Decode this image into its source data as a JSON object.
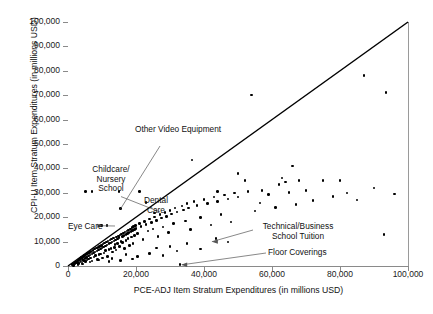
{
  "chart_data": {
    "type": "scatter",
    "title": "",
    "xlabel": "PCE-ADJ Item Stratum Expenditures (in millions USD)",
    "ylabel": "CPI-U Item Stratum Expenditures (in millions USD)",
    "xlim": [
      0,
      100000
    ],
    "ylim": [
      0,
      100000
    ],
    "xticks": [
      0,
      20000,
      40000,
      60000,
      80000,
      100000
    ],
    "xticklabels": [
      "0",
      "20,000",
      "40,000",
      "60,000",
      "80,000",
      "100,000"
    ],
    "yticks": [
      0,
      10000,
      20000,
      30000,
      40000,
      50000,
      60000,
      70000,
      80000,
      90000,
      100000
    ],
    "yticklabels": [
      "0",
      "10,000",
      "20,000",
      "30,000",
      "40,000",
      "50,000",
      "60,000",
      "70,000",
      "80,000",
      "90,000",
      "100,000"
    ],
    "grid": false,
    "legend": null,
    "marker": "filled-circle",
    "marker_color": "#000000",
    "reference_line": {
      "name": "identity-line",
      "description": "45-degree y = x line",
      "from": [
        0,
        0
      ],
      "to": [
        100000,
        100000
      ],
      "color": "#000000"
    },
    "annotations": [
      {
        "label": "Other Video Equipment",
        "point": [
          15500,
          23500
        ]
      },
      {
        "label": "Childcare/\nNursery\nSchool",
        "point": [
          7000,
          30500
        ]
      },
      {
        "label": "Dental\nCare",
        "point": [
          15000,
          30500
        ]
      },
      {
        "label": "Eye Care",
        "point": [
          9800,
          16500
        ]
      },
      {
        "label": "Technical/Business\nSchool Tuition",
        "point": [
          93000,
          13000
        ]
      },
      {
        "label": "Floor Coverings",
        "point": [
          33000,
          500
        ]
      }
    ],
    "points": [
      [
        1200,
        600
      ],
      [
        1500,
        900
      ],
      [
        1800,
        1100
      ],
      [
        2000,
        800
      ],
      [
        2200,
        1500
      ],
      [
        2400,
        1200
      ],
      [
        2600,
        1900
      ],
      [
        2800,
        1400
      ],
      [
        3000,
        2200
      ],
      [
        3100,
        1000
      ],
      [
        3300,
        2600
      ],
      [
        3500,
        1700
      ],
      [
        3600,
        3000
      ],
      [
        3800,
        2100
      ],
      [
        4000,
        3400
      ],
      [
        4100,
        1300
      ],
      [
        4300,
        2800
      ],
      [
        4500,
        3900
      ],
      [
        4600,
        2300
      ],
      [
        4800,
        4300
      ],
      [
        5000,
        3100
      ],
      [
        5100,
        1800
      ],
      [
        5300,
        4800
      ],
      [
        5500,
        3600
      ],
      [
        5600,
        2500
      ],
      [
        5800,
        5200
      ],
      [
        6000,
        4100
      ],
      [
        6100,
        2900
      ],
      [
        6300,
        5600
      ],
      [
        6500,
        4500
      ],
      [
        6600,
        3300
      ],
      [
        6800,
        6000
      ],
      [
        7000,
        4900
      ],
      [
        7100,
        2000
      ],
      [
        7300,
        6400
      ],
      [
        7500,
        5300
      ],
      [
        7600,
        3700
      ],
      [
        7800,
        6900
      ],
      [
        8000,
        5700
      ],
      [
        8100,
        4200
      ],
      [
        8300,
        7300
      ],
      [
        8500,
        6100
      ],
      [
        8600,
        2700
      ],
      [
        8800,
        7700
      ],
      [
        9000,
        6500
      ],
      [
        9100,
        4600
      ],
      [
        9300,
        8100
      ],
      [
        9500,
        7000
      ],
      [
        9600,
        5000
      ],
      [
        9800,
        8500
      ],
      [
        10000,
        7400
      ],
      [
        10100,
        3200
      ],
      [
        10300,
        9000
      ],
      [
        10500,
        7800
      ],
      [
        10600,
        5400
      ],
      [
        10800,
        9400
      ],
      [
        11000,
        8200
      ],
      [
        11100,
        6300
      ],
      [
        11300,
        9800
      ],
      [
        11500,
        8600
      ],
      [
        11600,
        4000
      ],
      [
        11800,
        10200
      ],
      [
        12000,
        9100
      ],
      [
        12100,
        6800
      ],
      [
        12300,
        10600
      ],
      [
        12500,
        9500
      ],
      [
        12600,
        7200
      ],
      [
        12800,
        11000
      ],
      [
        13000,
        9900
      ],
      [
        13100,
        5800
      ],
      [
        13300,
        11500
      ],
      [
        13500,
        10300
      ],
      [
        13600,
        7600
      ],
      [
        13800,
        8900
      ],
      [
        14000,
        10700
      ],
      [
        14100,
        6600
      ],
      [
        14300,
        11900
      ],
      [
        14500,
        11100
      ],
      [
        14600,
        9300
      ],
      [
        14800,
        12300
      ],
      [
        15000,
        11600
      ],
      [
        15100,
        8000
      ],
      [
        15300,
        12700
      ],
      [
        15500,
        23500
      ],
      [
        15600,
        10000
      ],
      [
        15800,
        13100
      ],
      [
        16000,
        12000
      ],
      [
        16100,
        9700
      ],
      [
        16300,
        13600
      ],
      [
        16500,
        12400
      ],
      [
        16600,
        7100
      ],
      [
        16800,
        14000
      ],
      [
        17000,
        12800
      ],
      [
        17100,
        10400
      ],
      [
        17300,
        14400
      ],
      [
        17500,
        13200
      ],
      [
        17600,
        11200
      ],
      [
        17800,
        14800
      ],
      [
        18000,
        13700
      ],
      [
        18100,
        8400
      ],
      [
        18300,
        15200
      ],
      [
        18500,
        14100
      ],
      [
        18600,
        11900
      ],
      [
        18800,
        15700
      ],
      [
        19000,
        14500
      ],
      [
        19100,
        9200
      ],
      [
        19300,
        16100
      ],
      [
        19500,
        15000
      ],
      [
        19600,
        12600
      ],
      [
        19800,
        16500
      ],
      [
        20000,
        15400
      ],
      [
        20500,
        13400
      ],
      [
        21000,
        17400
      ],
      [
        21500,
        16200
      ],
      [
        22000,
        10900
      ],
      [
        22500,
        18300
      ],
      [
        23000,
        17000
      ],
      [
        23500,
        14300
      ],
      [
        24000,
        19200
      ],
      [
        24500,
        17900
      ],
      [
        25000,
        15100
      ],
      [
        25500,
        20100
      ],
      [
        26000,
        18700
      ],
      [
        26500,
        12100
      ],
      [
        27000,
        21000
      ],
      [
        27500,
        19600
      ],
      [
        28000,
        16000
      ],
      [
        28500,
        21900
      ],
      [
        29000,
        20400
      ],
      [
        29500,
        13800
      ],
      [
        30000,
        22800
      ],
      [
        30500,
        21300
      ],
      [
        31000,
        17500
      ],
      [
        31500,
        23700
      ],
      [
        32000,
        22100
      ],
      [
        33000,
        500
      ],
      [
        33500,
        24600
      ],
      [
        34000,
        23000
      ],
      [
        34500,
        18400
      ],
      [
        35000,
        25500
      ],
      [
        35500,
        23800
      ],
      [
        36000,
        14900
      ],
      [
        37000,
        26400
      ],
      [
        38000,
        24700
      ],
      [
        39000,
        19800
      ],
      [
        40000,
        27300
      ],
      [
        41000,
        25600
      ],
      [
        42000,
        16800
      ],
      [
        43000,
        28200
      ],
      [
        44000,
        26500
      ],
      [
        45000,
        21200
      ],
      [
        46000,
        29100
      ],
      [
        47000,
        27400
      ],
      [
        48000,
        18000
      ],
      [
        49000,
        30000
      ],
      [
        50000,
        28300
      ],
      [
        52000,
        35000
      ],
      [
        54000,
        70000
      ],
      [
        55000,
        22600
      ],
      [
        57000,
        31000
      ],
      [
        59000,
        29200
      ],
      [
        61000,
        23900
      ],
      [
        63000,
        36000
      ],
      [
        64000,
        34500
      ],
      [
        65000,
        30100
      ],
      [
        67000,
        25200
      ],
      [
        68000,
        35000
      ],
      [
        70000,
        31000
      ],
      [
        72000,
        26800
      ],
      [
        75000,
        35000
      ],
      [
        78000,
        28400
      ],
      [
        80000,
        35000
      ],
      [
        82000,
        30000
      ],
      [
        85000,
        27000
      ],
      [
        87000,
        78000
      ],
      [
        90000,
        32000
      ],
      [
        93000,
        13000
      ],
      [
        93500,
        71000
      ],
      [
        96000,
        29500
      ],
      [
        5200,
        30500
      ],
      [
        7000,
        30500
      ],
      [
        15000,
        30500
      ],
      [
        9800,
        16500
      ],
      [
        11500,
        16500
      ],
      [
        21000,
        30500
      ],
      [
        23000,
        26000
      ],
      [
        25500,
        21800
      ],
      [
        36500,
        43500
      ],
      [
        44000,
        30500
      ],
      [
        50000,
        38000
      ],
      [
        53000,
        30500
      ],
      [
        56500,
        25800
      ],
      [
        62000,
        33500
      ],
      [
        66000,
        41000
      ],
      [
        30000,
        8000
      ],
      [
        32000,
        6200
      ],
      [
        26000,
        7400
      ],
      [
        35000,
        9100
      ],
      [
        39000,
        6900
      ],
      [
        43500,
        11200
      ],
      [
        47000,
        9800
      ],
      [
        24000,
        5100
      ],
      [
        28000,
        4300
      ],
      [
        20500,
        3900
      ],
      [
        17000,
        4800
      ],
      [
        19000,
        2900
      ],
      [
        13000,
        3100
      ],
      [
        15500,
        2200
      ],
      [
        9000,
        2400
      ],
      [
        6500,
        1600
      ],
      [
        4200,
        900
      ],
      [
        2900,
        500
      ],
      [
        1600,
        300
      ],
      [
        12000,
        1900
      ]
    ]
  }
}
